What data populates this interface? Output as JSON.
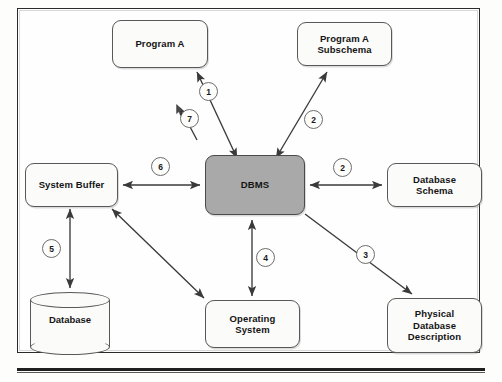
{
  "figure": {
    "frame": {
      "border_color": "#2b2b2b"
    },
    "accent_color": "#a9a9a9",
    "node_border_color": "#585858",
    "arrow_color": "#3a3a3a"
  },
  "nodes": [
    {
      "id": "program-a",
      "label": "Program A"
    },
    {
      "id": "program-a-subschema",
      "label": "Program A\nSubschema"
    },
    {
      "id": "system-buffer",
      "label": "System Buffer"
    },
    {
      "id": "dbms",
      "label": "DBMS"
    },
    {
      "id": "database-schema",
      "label": "Database\nSchema"
    },
    {
      "id": "database",
      "label": "Database"
    },
    {
      "id": "operating-system",
      "label": "Operating\nSystem"
    },
    {
      "id": "physical-db-desc",
      "label": "Physical\nDatabase\nDescription"
    }
  ],
  "steps": [
    {
      "number": "1",
      "from": "dbms",
      "to": "program-a",
      "direction": "bidirectional"
    },
    {
      "number": "2",
      "from": "dbms",
      "to": "program-a-subschema",
      "direction": "bidirectional"
    },
    {
      "number": "2",
      "from": "dbms",
      "to": "database-schema",
      "direction": "bidirectional"
    },
    {
      "number": "3",
      "from": "dbms",
      "to": "physical-db-desc",
      "direction": "unidirectional"
    },
    {
      "number": "4",
      "from": "dbms",
      "to": "operating-system",
      "direction": "bidirectional"
    },
    {
      "number": "5",
      "from": "system-buffer",
      "to": "database",
      "direction": "bidirectional"
    },
    {
      "number": "6",
      "from": "system-buffer",
      "to": "dbms",
      "direction": "bidirectional"
    },
    {
      "number": "7",
      "from": "operating-system",
      "to": "system-buffer",
      "direction": "bidirectional"
    }
  ]
}
